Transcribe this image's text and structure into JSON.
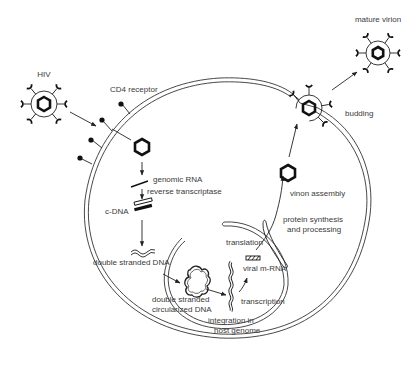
{
  "labels": {
    "hiv": "HIV",
    "cd4_receptor": "CD4 receptor",
    "genomic_rna": "genomic RNA",
    "reverse_transcriptase": "reverse transcriptase",
    "c_dna": "c-DNA",
    "double_stranded_dna": "double stranded DNA",
    "circularized_line1": "double stranded",
    "circularized_line2": "circularized DNA",
    "integration_line1": "integration in",
    "integration_line2": "host genome",
    "transcription": "transcription",
    "viral_mrna": "viral m-RNA",
    "translation": "translation",
    "protein_line1": "protein synthesis",
    "protein_line2": "and processing",
    "virion_assembly": "vinon assembly",
    "budding": "budding",
    "mature_virion": "mature virion"
  },
  "steps": [
    "HIV",
    "CD4 receptor",
    "genomic RNA",
    "reverse transcriptase",
    "c-DNA",
    "double stranded DNA",
    "double stranded circularized DNA",
    "integration in host genome",
    "transcription",
    "viral m-RNA",
    "translation",
    "protein synthesis and processing",
    "vinon assembly",
    "budding",
    "mature virion"
  ],
  "colors": {
    "ink": "#222222",
    "text": "#3a3a3a",
    "background": "#ffffff"
  }
}
